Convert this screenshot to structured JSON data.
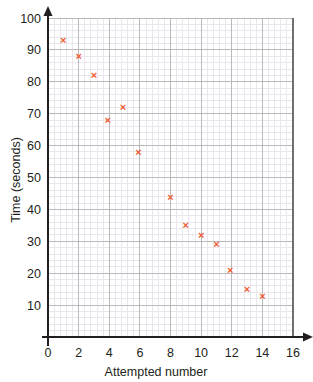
{
  "chart_data": {
    "type": "scatter",
    "title": "",
    "xlabel": "Attempted number",
    "ylabel": "Time (seconds)",
    "xlim": [
      0,
      16
    ],
    "ylim": [
      0,
      100
    ],
    "x_ticks": [
      0,
      2,
      4,
      6,
      8,
      10,
      12,
      14,
      16
    ],
    "y_ticks": [
      10,
      20,
      30,
      40,
      50,
      60,
      70,
      80,
      90,
      100
    ],
    "x_major_step": 2,
    "y_major_step": 10,
    "minor_per_major": 5,
    "grid": true,
    "legend": "none",
    "marker": "x",
    "marker_color": "#ef5b32",
    "axis_color": "#231f20",
    "grid_major_color": "#b9b9bb",
    "grid_minor_color": "#e9e6ee",
    "points": [
      {
        "x": 1,
        "y": 93
      },
      {
        "x": 2,
        "y": 88
      },
      {
        "x": 3,
        "y": 82
      },
      {
        "x": 3.9,
        "y": 68
      },
      {
        "x": 4.9,
        "y": 72
      },
      {
        "x": 5.9,
        "y": 58
      },
      {
        "x": 8,
        "y": 44
      },
      {
        "x": 9,
        "y": 35
      },
      {
        "x": 10,
        "y": 32
      },
      {
        "x": 11,
        "y": 29
      },
      {
        "x": 11.9,
        "y": 21
      },
      {
        "x": 13,
        "y": 15
      },
      {
        "x": 14,
        "y": 13
      }
    ],
    "x_tick_labels": [
      "0",
      "2",
      "4",
      "6",
      "8",
      "10",
      "12",
      "14",
      "16"
    ],
    "y_tick_labels": [
      "10",
      "20",
      "30",
      "40",
      "50",
      "60",
      "70",
      "80",
      "90",
      "100"
    ]
  }
}
